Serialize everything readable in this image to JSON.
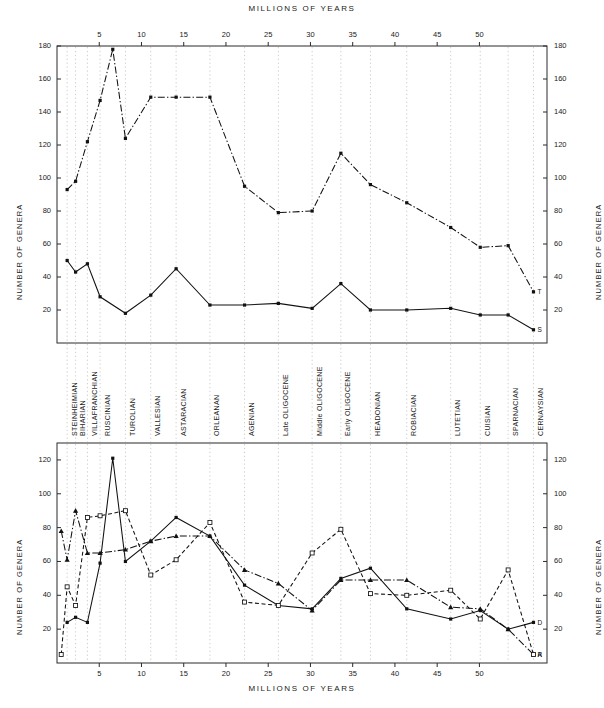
{
  "figure": {
    "top_title": "MILLIONS OF YEARS",
    "bottom_title": "MILLIONS OF YEARS",
    "y_axis_label": "NUMBER OF GENERA"
  },
  "stages": [
    {
      "label": "STEINHEIMIAN",
      "x": 1.2
    },
    {
      "label": "BIHARIAN",
      "x": 2.2
    },
    {
      "label": "VILLAFRANCHIAN",
      "x": 3.6
    },
    {
      "label": "RUSCINIAN",
      "x": 5.1
    },
    {
      "label": "TUROLIAN",
      "x": 8.1
    },
    {
      "label": "VALLESIAN",
      "x": 11.1
    },
    {
      "label": "ASTARACIAN",
      "x": 14.1
    },
    {
      "label": "ORLEANAN",
      "x": 18.1
    },
    {
      "label": "AGENIAN",
      "x": 22.2
    },
    {
      "label": "Late OLIGOCENE",
      "x": 26.2
    },
    {
      "label": "Middle OLIGOCENE",
      "x": 30.2
    },
    {
      "label": "Early OLIGOCENE",
      "x": 33.6
    },
    {
      "label": "HEADONIAN",
      "x": 37.1
    },
    {
      "label": "ROBIACIAN",
      "x": 41.4
    },
    {
      "label": "LUTETIAN",
      "x": 46.6
    },
    {
      "label": "CUISIAN",
      "x": 50.1
    },
    {
      "label": "SPARNACIAN",
      "x": 53.4
    },
    {
      "label": "CERNAYSIAN",
      "x": 56.4
    }
  ],
  "chart_data": [
    {
      "type": "line",
      "panel": "top",
      "title": "MILLIONS OF YEARS",
      "xlabel": "MILLIONS OF YEARS",
      "ylabel": "NUMBER OF GENERA",
      "xlim": [
        0,
        58
      ],
      "ylim": [
        0,
        180
      ],
      "xticks": [
        5,
        10,
        15,
        20,
        25,
        30,
        35,
        40,
        45,
        50
      ],
      "yticks": [
        20,
        40,
        60,
        80,
        100,
        120,
        140,
        160,
        180
      ],
      "grid": "vertical-dotted-at-stage-boundaries",
      "legend": "end-of-line-letters",
      "series": [
        {
          "name": "T",
          "style": "dash-dot",
          "marker": "filled-square",
          "end_label": "T",
          "x": [
            1.2,
            2.2,
            3.6,
            5.1,
            6.6,
            8.1,
            11.1,
            14.1,
            18.1,
            22.2,
            26.2,
            30.2,
            33.6,
            37.1,
            41.4,
            46.6,
            50.1,
            53.4,
            56.4
          ],
          "y": [
            93,
            98,
            122,
            147,
            178,
            124,
            149,
            149,
            149,
            95,
            79,
            80,
            115,
            96,
            85,
            70,
            58,
            59,
            31
          ]
        },
        {
          "name": "S",
          "style": "solid",
          "marker": "filled-square",
          "end_label": "S",
          "x": [
            1.2,
            2.2,
            3.6,
            5.1,
            8.1,
            11.1,
            14.1,
            18.1,
            22.2,
            26.2,
            30.2,
            33.6,
            37.1,
            41.4,
            46.6,
            50.1,
            53.4,
            56.4
          ],
          "y": [
            50,
            43,
            48,
            28,
            18,
            29,
            45,
            23,
            23,
            24,
            21,
            36,
            20,
            20,
            21,
            17,
            17,
            8
          ]
        }
      ]
    },
    {
      "type": "line",
      "panel": "bottom",
      "title": "MILLIONS OF YEARS",
      "xlabel": "MILLIONS OF YEARS",
      "ylabel": "NUMBER OF GENERA",
      "xlim": [
        0,
        58
      ],
      "ylim": [
        0,
        130
      ],
      "xticks": [
        5,
        10,
        15,
        20,
        25,
        30,
        35,
        40,
        45,
        50
      ],
      "yticks": [
        20,
        40,
        60,
        80,
        100,
        120
      ],
      "grid": "vertical-dotted-at-stage-boundaries",
      "legend": "end-of-line-letters",
      "series": [
        {
          "name": "D",
          "style": "solid",
          "marker": "filled-square",
          "end_label": "D",
          "x": [
            1.2,
            2.2,
            3.6,
            5.1,
            6.6,
            8.1,
            11.1,
            14.1,
            18.1,
            22.2,
            26.2,
            30.2,
            33.6,
            37.1,
            41.4,
            46.6,
            50.1,
            53.4,
            56.4
          ],
          "y": [
            24,
            27,
            24,
            59,
            121,
            60,
            72,
            86,
            75,
            46,
            34,
            32,
            50,
            56,
            32,
            26,
            31,
            20,
            24
          ]
        },
        {
          "name": "A",
          "style": "dash-dot",
          "marker": "filled-triangle",
          "end_label": "A",
          "x": [
            0.5,
            1.2,
            2.2,
            3.6,
            5.1,
            8.1,
            11.1,
            14.1,
            18.1,
            22.2,
            26.2,
            30.2,
            33.6,
            37.1,
            41.4,
            46.6,
            50.1,
            53.4,
            56.4
          ],
          "y": [
            78,
            61,
            90,
            65,
            65,
            67,
            72,
            75,
            75,
            55,
            47,
            31,
            49,
            49,
            49,
            33,
            32,
            20,
            5
          ]
        },
        {
          "name": "R",
          "style": "dashed",
          "marker": "open-square",
          "end_label": "R",
          "x": [
            0.5,
            1.2,
            2.2,
            3.6,
            5.1,
            8.1,
            11.1,
            14.1,
            18.1,
            22.2,
            26.2,
            30.2,
            33.6,
            37.1,
            41.4,
            46.6,
            50.1,
            53.4,
            56.4
          ],
          "y": [
            5,
            45,
            34,
            86,
            87,
            90,
            52,
            61,
            83,
            36,
            34,
            65,
            79,
            41,
            40,
            43,
            26,
            55,
            5
          ]
        }
      ]
    }
  ]
}
